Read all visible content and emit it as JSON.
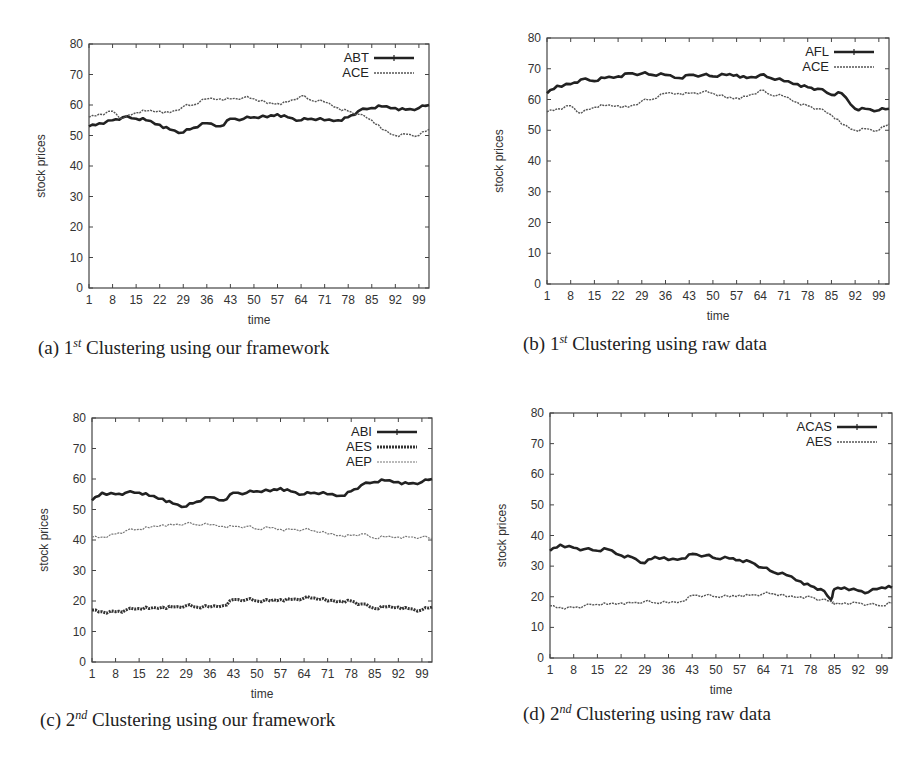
{
  "chart_data": [
    {
      "id": "a",
      "type": "line",
      "caption_prefix": "(a) 1",
      "caption_sup": "st",
      "caption_rest": " Clustering using our framework",
      "xlabel": "time",
      "ylabel": "stock prices",
      "ylim": [
        0,
        80
      ],
      "yticks": [
        0,
        10,
        20,
        30,
        40,
        50,
        60,
        70,
        80
      ],
      "xlim": [
        1,
        102
      ],
      "xticks": [
        1,
        8,
        15,
        22,
        29,
        36,
        43,
        50,
        57,
        64,
        71,
        78,
        85,
        92,
        99
      ],
      "x": [
        1,
        4,
        8,
        11,
        15,
        18,
        22,
        25,
        29,
        32,
        36,
        40,
        43,
        47,
        50,
        54,
        57,
        60,
        64,
        67,
        71,
        75,
        78,
        81,
        85,
        88,
        92,
        95,
        99,
        102
      ],
      "series": [
        {
          "name": "ABT",
          "style": "solid-points",
          "values": [
            53,
            54,
            55,
            56,
            55.5,
            55,
            53.5,
            52,
            51,
            52.5,
            54,
            53,
            55.5,
            55.5,
            56,
            56,
            57,
            56,
            55,
            55.5,
            55,
            55,
            56,
            58,
            59,
            59.5,
            59,
            58.5,
            59,
            60
          ]
        },
        {
          "name": "ACE",
          "style": "dotted",
          "values": [
            56,
            57,
            58,
            55.5,
            57.5,
            58,
            58,
            57.5,
            59.5,
            60,
            62,
            62,
            62,
            62.5,
            62,
            60.5,
            60.5,
            61,
            63,
            61.5,
            61,
            59,
            58,
            57,
            55,
            52,
            50,
            50.5,
            50,
            52
          ]
        }
      ],
      "grid": false,
      "legend_position": "top-right"
    },
    {
      "id": "b",
      "type": "line",
      "caption_prefix": "(b) 1",
      "caption_sup": "st",
      "caption_rest": " Clustering using raw data",
      "xlabel": "time",
      "ylabel": "stock prices",
      "ylim": [
        0,
        80
      ],
      "yticks": [
        0,
        10,
        20,
        30,
        40,
        50,
        60,
        70,
        80
      ],
      "xlim": [
        1,
        102
      ],
      "xticks": [
        1,
        8,
        15,
        22,
        29,
        36,
        43,
        50,
        57,
        64,
        71,
        78,
        85,
        92,
        99
      ],
      "x": [
        1,
        4,
        8,
        11,
        15,
        18,
        22,
        25,
        29,
        32,
        36,
        40,
        43,
        47,
        50,
        54,
        57,
        60,
        64,
        67,
        71,
        75,
        78,
        81,
        85,
        88,
        92,
        95,
        99,
        102
      ],
      "series": [
        {
          "name": "AFL",
          "style": "solid-points",
          "values": [
            62,
            64.5,
            65,
            66.5,
            66,
            67,
            67.5,
            68.5,
            68.5,
            68,
            68,
            67,
            68,
            68,
            67.5,
            68,
            68,
            67,
            68,
            67,
            66,
            65,
            64,
            63.5,
            61.5,
            62,
            57,
            57,
            56.5,
            57
          ]
        },
        {
          "name": "ACE",
          "style": "dotted",
          "values": [
            56,
            57,
            58,
            55.5,
            57.5,
            58,
            58,
            57.5,
            59.5,
            60,
            62,
            62,
            62,
            62.5,
            62,
            60.5,
            60.5,
            61,
            63,
            61.5,
            61,
            59,
            58,
            57,
            55,
            52,
            50,
            50.5,
            50,
            52
          ]
        }
      ],
      "grid": false,
      "legend_position": "top-right"
    },
    {
      "id": "c",
      "type": "line",
      "caption_prefix": "(c) 2",
      "caption_sup": "nd",
      "caption_rest": " Clustering using our framework",
      "xlabel": "time",
      "ylabel": "stock prices",
      "ylim": [
        0,
        80
      ],
      "yticks": [
        0,
        10,
        20,
        30,
        40,
        50,
        60,
        70,
        80
      ],
      "xlim": [
        1,
        102
      ],
      "xticks": [
        1,
        8,
        15,
        22,
        29,
        36,
        43,
        50,
        57,
        64,
        71,
        78,
        85,
        92,
        99
      ],
      "x": [
        1,
        4,
        8,
        11,
        15,
        18,
        22,
        25,
        29,
        32,
        36,
        40,
        43,
        47,
        50,
        54,
        57,
        60,
        64,
        67,
        71,
        75,
        78,
        81,
        85,
        88,
        92,
        95,
        99,
        102
      ],
      "series": [
        {
          "name": "ABI",
          "style": "solid-points",
          "values": [
            53,
            55.5,
            55,
            55.5,
            55.5,
            54.5,
            53.5,
            52,
            51,
            52.5,
            54,
            53,
            55.5,
            55.5,
            56,
            56,
            57,
            56,
            55,
            55.5,
            55,
            54.5,
            56,
            58,
            59,
            59.5,
            59,
            58.5,
            59,
            60
          ]
        },
        {
          "name": "AES",
          "style": "thick-dotted",
          "values": [
            17,
            16.5,
            16.5,
            17,
            17.5,
            17.5,
            18,
            18,
            18.5,
            18,
            18,
            18.5,
            20.5,
            20.5,
            20,
            20,
            20.5,
            20.5,
            21,
            21,
            20,
            20,
            20,
            19,
            17.5,
            18,
            18,
            17.5,
            17,
            18
          ]
        },
        {
          "name": "AEP",
          "style": "thin-dotted",
          "values": [
            41,
            41,
            42,
            43,
            43.5,
            44,
            45,
            45,
            45.5,
            45,
            45,
            44.5,
            44.5,
            44.5,
            43.5,
            44,
            43.5,
            43.5,
            43.5,
            43,
            42,
            41.5,
            41.5,
            42,
            40.5,
            41,
            41,
            41,
            41,
            40.5
          ]
        }
      ],
      "grid": false,
      "legend_position": "top-right"
    },
    {
      "id": "d",
      "type": "line",
      "caption_prefix": "(d) 2",
      "caption_sup": "nd",
      "caption_rest": " Clustering using raw data",
      "xlabel": "time",
      "ylabel": "stock prices",
      "ylim": [
        0,
        80
      ],
      "yticks": [
        0,
        10,
        20,
        30,
        40,
        50,
        60,
        70,
        80
      ],
      "xlim": [
        1,
        102
      ],
      "xticks": [
        1,
        8,
        15,
        22,
        29,
        36,
        43,
        50,
        57,
        64,
        71,
        78,
        85,
        92,
        99
      ],
      "x": [
        1,
        4,
        8,
        11,
        15,
        18,
        22,
        25,
        29,
        32,
        36,
        40,
        43,
        47,
        50,
        54,
        57,
        60,
        64,
        67,
        71,
        75,
        78,
        81,
        84,
        85,
        88,
        92,
        95,
        99,
        102
      ],
      "series": [
        {
          "name": "ACAS",
          "style": "solid-points",
          "values": [
            35,
            37,
            36,
            35.5,
            35,
            35.5,
            33.5,
            33,
            31,
            33,
            32,
            32.5,
            34,
            33.5,
            32.5,
            32.5,
            32,
            31.5,
            29.5,
            28,
            27,
            25,
            23.5,
            22.5,
            19,
            22.5,
            23,
            22,
            21.5,
            23,
            23
          ]
        },
        {
          "name": "AES",
          "style": "dotted",
          "values": [
            17,
            16.5,
            16.5,
            17,
            17.5,
            17.5,
            18,
            18,
            18.5,
            18,
            18,
            18.5,
            20.5,
            20.5,
            20,
            20,
            20.5,
            20.5,
            21,
            21,
            20,
            20,
            20,
            19,
            18.5,
            17.5,
            18,
            18,
            17.5,
            17,
            18
          ]
        }
      ],
      "grid": false,
      "legend_position": "top-right"
    }
  ]
}
